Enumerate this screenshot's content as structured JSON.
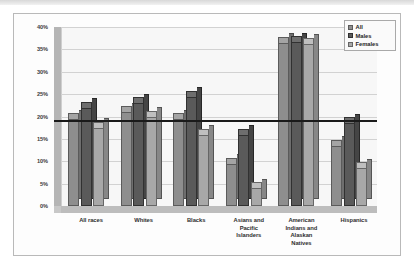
{
  "chart_data": {
    "type": "bar",
    "title": "",
    "xlabel": "",
    "ylabel": "",
    "ylim": [
      0,
      40
    ],
    "ytick_labels": [
      "0%",
      "5%",
      "10%",
      "15%",
      "20%",
      "25%",
      "30%",
      "35%",
      "40%"
    ],
    "ytick_values": [
      0,
      5,
      10,
      15,
      20,
      25,
      30,
      35,
      40
    ],
    "grid": true,
    "legend_position": "top-right",
    "reference_line": {
      "value": 20,
      "label": "20%",
      "color": "#1a1a1a"
    },
    "categories": [
      "All races",
      "Whites",
      "Blacks",
      "Asians and Pacific Islanders",
      "American Indians and Alaskan Natives",
      "Hispanics"
    ],
    "series": [
      {
        "name": "All",
        "color": "#8e8e8e",
        "values": [
          20.0,
          21.5,
          20.0,
          10.0,
          37.0,
          14.0
        ]
      },
      {
        "name": "Males",
        "color": "#5a5a5a",
        "values": [
          22.5,
          23.5,
          25.0,
          16.5,
          37.2,
          19.0
        ]
      },
      {
        "name": "Females",
        "color": "#a8a8a8",
        "values": [
          18.0,
          20.5,
          16.5,
          4.5,
          36.8,
          9.0
        ]
      }
    ]
  },
  "legend": {
    "items": [
      {
        "label": "All"
      },
      {
        "label": "Males"
      },
      {
        "label": "Females"
      }
    ]
  },
  "axis": {
    "y_labels": [
      "40%",
      "35%",
      "30%",
      "25%",
      "20%",
      "15%",
      "10%",
      "5%",
      "0%"
    ],
    "x_labels": [
      "All races",
      "Whites",
      "Blacks",
      "Asians and\nPacific\nIslanders",
      "American\nIndians and\nAlaskan\nNatives",
      "Hispanics"
    ]
  }
}
